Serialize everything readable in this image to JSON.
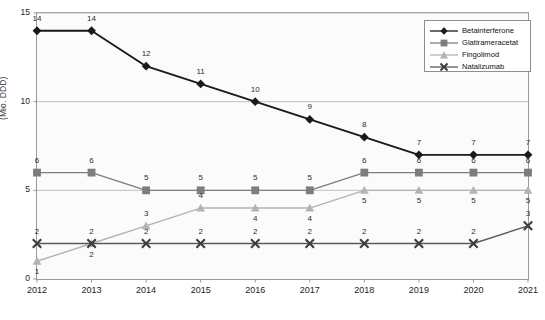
{
  "chart_data": {
    "type": "line",
    "title": "",
    "xlabel": "",
    "ylabel": "(Mio. DDD)",
    "categories": [
      "2012",
      "2013",
      "2014",
      "2015",
      "2016",
      "2017",
      "2018",
      "2019",
      "2020",
      "2021"
    ],
    "ylim": [
      0,
      15
    ],
    "yticks": [
      "0",
      "5",
      "10",
      "15"
    ],
    "grid": "horizontal",
    "legend_position": "top-right",
    "series": [
      {
        "name": "Betainterferone",
        "marker": "diamond",
        "color": "#1a1a1a",
        "values": [
          14,
          14,
          12,
          11,
          10,
          9,
          8,
          7,
          7,
          7
        ],
        "label_positions": [
          "above",
          "above",
          "above",
          "above",
          "above",
          "above",
          "above",
          "above",
          "above",
          "above"
        ]
      },
      {
        "name": "Glatirameracetat",
        "marker": "square",
        "color": "#7d7d7d",
        "values": [
          6,
          6,
          5,
          5,
          5,
          5,
          6,
          6,
          6,
          6
        ],
        "label_positions": [
          "above",
          "above",
          "above",
          "above",
          "above",
          "above",
          "above",
          "above",
          "above",
          "above"
        ]
      },
      {
        "name": "Fingolimod",
        "marker": "triangle",
        "color": "#b3b3b3",
        "values": [
          1,
          2,
          3,
          4,
          4,
          4,
          5,
          5,
          5,
          5
        ],
        "label_positions": [
          "below",
          "below",
          "above",
          "above",
          "below",
          "below",
          "below",
          "below",
          "below",
          "below"
        ]
      },
      {
        "name": "Natalizumab",
        "marker": "cross",
        "color": "#5a5a5a",
        "values": [
          2,
          2,
          2,
          2,
          2,
          2,
          2,
          2,
          2,
          3
        ],
        "label_positions": [
          "above",
          "above",
          "above",
          "above",
          "above",
          "above",
          "above",
          "above",
          "above",
          "above"
        ]
      }
    ]
  },
  "colors": {
    "plot_background": "#fbfbfb",
    "frame": "#9a9a9a",
    "gridline": "#b9b9b9",
    "axis_text": "#222222"
  }
}
